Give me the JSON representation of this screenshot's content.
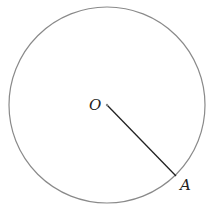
{
  "diagram": {
    "type": "circle-with-radius",
    "circle": {
      "cx": 107,
      "cy": 105,
      "r": 98,
      "stroke": "#8a8a8a"
    },
    "center": {
      "label": "O",
      "x": 107,
      "y": 105
    },
    "point": {
      "label": "A",
      "x": 176,
      "y": 176
    },
    "segment": {
      "from": "O",
      "to": "A",
      "stroke": "#222222"
    }
  }
}
